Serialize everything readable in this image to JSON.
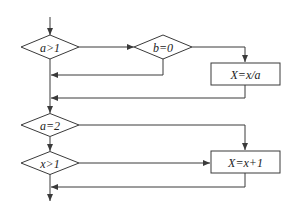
{
  "diagram": {
    "type": "flowchart",
    "colors": {
      "stroke": "#3a3a3a",
      "text": "#222222",
      "background": "#ffffff"
    },
    "nodes": [
      {
        "id": "d1",
        "shape": "diamond",
        "label": "a>1",
        "cx": 50,
        "cy": 47,
        "w": 58,
        "h": 24
      },
      {
        "id": "d2",
        "shape": "diamond",
        "label": "b=0",
        "cx": 163,
        "cy": 47,
        "w": 58,
        "h": 24
      },
      {
        "id": "p1",
        "shape": "rect",
        "label": "X=x/a",
        "x": 211,
        "y": 63,
        "w": 69,
        "h": 22
      },
      {
        "id": "d3",
        "shape": "diamond",
        "label": "a=2",
        "cx": 50,
        "cy": 125,
        "w": 58,
        "h": 23
      },
      {
        "id": "d4",
        "shape": "diamond",
        "label": "x>1",
        "cx": 50,
        "cy": 163,
        "w": 58,
        "h": 23
      },
      {
        "id": "p2",
        "shape": "rect",
        "label": "X=x+1",
        "x": 211,
        "y": 151,
        "w": 69,
        "h": 22
      }
    ],
    "edges": [
      {
        "from": "start",
        "to": "d1",
        "points": [
          [
            50,
            17
          ],
          [
            50,
            35
          ]
        ],
        "arrow": true
      },
      {
        "from": "d1",
        "to": "d2",
        "label": "",
        "points": [
          [
            79,
            47
          ],
          [
            134,
            47
          ]
        ],
        "arrow": true
      },
      {
        "from": "d2",
        "to": "p1",
        "label": "",
        "points": [
          [
            192,
            47
          ],
          [
            245,
            47
          ],
          [
            245,
            62
          ]
        ],
        "arrow": true
      },
      {
        "from": "d2",
        "to": "main",
        "label": "",
        "points": [
          [
            163,
            58
          ],
          [
            163,
            75
          ],
          [
            51,
            75
          ]
        ],
        "arrow": true
      },
      {
        "from": "p1",
        "to": "main",
        "label": "",
        "points": [
          [
            245,
            85
          ],
          [
            245,
            98
          ],
          [
            51,
            98
          ]
        ],
        "arrow": true
      },
      {
        "from": "d1",
        "to": "d3",
        "label": "",
        "points": [
          [
            50,
            59
          ],
          [
            50,
            113
          ]
        ],
        "arrow": true
      },
      {
        "from": "d3",
        "to": "p2",
        "label": "",
        "points": [
          [
            79,
            125
          ],
          [
            245,
            125
          ],
          [
            245,
            150
          ]
        ],
        "arrow": true
      },
      {
        "from": "d3",
        "to": "d4",
        "label": "",
        "points": [
          [
            50,
            137
          ],
          [
            50,
            151
          ]
        ],
        "arrow": true
      },
      {
        "from": "d4",
        "to": "p2",
        "label": "",
        "points": [
          [
            79,
            163
          ],
          [
            210,
            163
          ]
        ],
        "arrow": true
      },
      {
        "from": "p2",
        "to": "main",
        "label": "",
        "points": [
          [
            245,
            173
          ],
          [
            245,
            187
          ],
          [
            51,
            187
          ]
        ],
        "arrow": true
      },
      {
        "from": "d4",
        "to": "end",
        "label": "",
        "points": [
          [
            50,
            174
          ],
          [
            50,
            201
          ]
        ],
        "arrow": true
      }
    ]
  }
}
